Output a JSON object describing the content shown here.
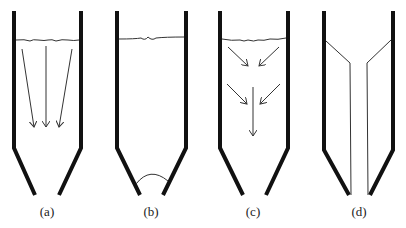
{
  "diagram": {
    "type": "settling-tank-schematic",
    "panels": [
      {
        "id": "a",
        "label": "(a)",
        "description": "vertical downward flow arrows below liquid surface"
      },
      {
        "id": "b",
        "label": "(b)",
        "description": "liquid surface with arc at bottom outlet"
      },
      {
        "id": "c",
        "label": "(c)",
        "description": "converging arrows toward center then downward"
      },
      {
        "id": "d",
        "label": "(d)",
        "description": "inner baffle plates forming central channel"
      }
    ],
    "colors": {
      "wall": "#111111",
      "line": "#333333",
      "background": "#ffffff"
    }
  }
}
